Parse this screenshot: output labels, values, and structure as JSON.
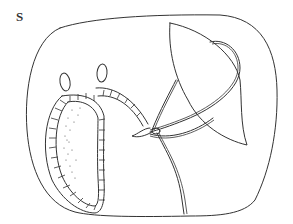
{
  "figure": {
    "label": "S",
    "stroke_color": "#333333",
    "background": "#ffffff"
  }
}
